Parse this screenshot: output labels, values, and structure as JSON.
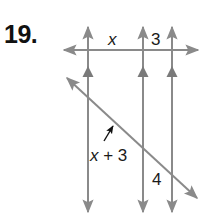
{
  "problem": {
    "number": "19."
  },
  "diagram": {
    "line_color": "#8a8a8a",
    "label_color": "#1a1a1a",
    "parallel_lines": [
      {
        "id": "p1",
        "x": 88
      },
      {
        "id": "p2",
        "x": 143
      },
      {
        "id": "p3",
        "x": 172
      }
    ],
    "transversals": [
      {
        "id": "horizontal",
        "from": [
          64,
          50
        ],
        "to": [
          198,
          50
        ]
      },
      {
        "id": "diagonal",
        "from": [
          67,
          78
        ],
        "to": [
          197,
          198
        ]
      }
    ],
    "segment_labels": {
      "top_left": "x",
      "top_right": "3",
      "bottom_left": "x + 3",
      "bottom_right": "4"
    }
  }
}
